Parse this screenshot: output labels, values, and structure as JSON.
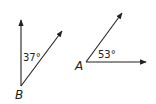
{
  "figure": {
    "stroke_color": "#231f20",
    "angles": [
      {
        "vertex_label": "B",
        "measure_label": "37°",
        "vertex": [
          21,
          86
        ],
        "ray1_end": [
          21,
          20
        ],
        "ray2_end": [
          62,
          31
        ]
      },
      {
        "vertex_label": "A",
        "measure_label": "53°",
        "vertex": [
          86,
          62
        ],
        "ray1_end": [
          146,
          62
        ],
        "ray2_end": [
          122,
          13
        ]
      }
    ]
  }
}
